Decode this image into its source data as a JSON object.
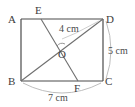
{
  "figure": {
    "type": "geometry-diagram",
    "shape": "rectangle",
    "title": "",
    "vertices": [
      {
        "id": "A",
        "label": "A",
        "position": "top-left"
      },
      {
        "id": "D",
        "label": "D",
        "position": "top-right"
      },
      {
        "id": "B",
        "label": "B",
        "position": "bottom-left"
      },
      {
        "id": "C",
        "label": "C",
        "position": "bottom-right"
      },
      {
        "id": "E",
        "label": "E",
        "position": "top-edge"
      },
      {
        "id": "F",
        "label": "F",
        "position": "bottom-edge"
      },
      {
        "id": "O",
        "label": "O",
        "position": "interior-intersection"
      }
    ],
    "segments": [
      {
        "from": "A",
        "to": "D"
      },
      {
        "from": "D",
        "to": "C"
      },
      {
        "from": "C",
        "to": "B"
      },
      {
        "from": "B",
        "to": "A"
      },
      {
        "from": "B",
        "to": "D"
      },
      {
        "from": "E",
        "to": "F"
      }
    ],
    "dimensions": [
      {
        "id": "od",
        "label": "4 cm",
        "value": 4,
        "unit": "cm",
        "applies_to": "O-D"
      },
      {
        "id": "dc",
        "label": "5 cm",
        "value": 5,
        "unit": "cm",
        "applies_to": "D-C"
      },
      {
        "id": "bc",
        "label": "7 cm",
        "value": 7,
        "unit": "cm",
        "applies_to": "B-C"
      }
    ],
    "angle_marks": [
      {
        "at": "O",
        "style": "arc"
      }
    ],
    "colors": {
      "outline": "#4a4a4a",
      "inner_line": "#6e6e6e",
      "dimension_arc": "#8c8c8c",
      "leader": "#b0b0b0",
      "text": "#3d3d3d",
      "background": "#ffffff"
    }
  }
}
